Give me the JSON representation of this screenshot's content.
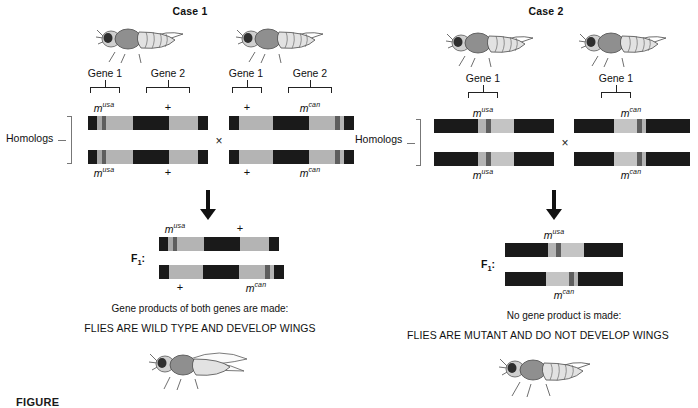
{
  "figure": {
    "caption_partial": "FIGURE",
    "background": "#ffffff"
  },
  "colors": {
    "band_black": "#1a1a1a",
    "band_gray": "#a8a8a8",
    "band_light": "#c8c8c8",
    "band_marker": "#666666",
    "bracket": "#222222",
    "homolog_bracket": "#777777",
    "text": "#111111"
  },
  "labels": {
    "homologs": "Homologs",
    "f1": "F",
    "f1_sub": "1",
    "f1_colon": ":",
    "cross_symbol": "×",
    "plus": "+",
    "gene1": "Gene 1",
    "gene2": "Gene 2"
  },
  "alleles": {
    "m_usa_base": "m",
    "m_usa_sup": "usa",
    "m_can_base": "m",
    "m_can_sup": "can"
  },
  "case1": {
    "title": "Case 1",
    "parent_left": {
      "gene_labels": [
        "Gene 1",
        "Gene 2"
      ],
      "top_allele_gene1": "m^usa",
      "top_allele_gene2": "+",
      "bottom_allele_gene1": "m^usa",
      "bottom_allele_gene2": "+"
    },
    "parent_right": {
      "gene_labels": [
        "Gene 1",
        "Gene 2"
      ],
      "top_allele_gene1": "+",
      "top_allele_gene2": "m^can",
      "bottom_allele_gene1": "+",
      "bottom_allele_gene2": "m^can"
    },
    "f1": {
      "top_left_allele": "m^usa",
      "top_right_allele": "+",
      "bottom_left_allele": "+",
      "bottom_right_allele": "m^can"
    },
    "result_line1": "Gene products of both genes are made:",
    "result_line2": "FLIES ARE WILD TYPE AND DEVELOP WINGS",
    "result_fly": "winged-wild-type-fly"
  },
  "case2": {
    "title": "Case 2",
    "parent_left": {
      "gene_labels": [
        "Gene 1"
      ],
      "top_allele_gene1": "m^usa",
      "bottom_allele_gene1": "m^usa"
    },
    "parent_right": {
      "gene_labels": [
        "Gene 1"
      ],
      "top_allele_gene1": "m^can",
      "bottom_allele_gene1": "m^can"
    },
    "f1": {
      "top_allele": "m^usa",
      "bottom_allele": "m^can"
    },
    "result_line1": "No gene product is made:",
    "result_line2": "FLIES ARE MUTANT AND DO NOT DEVELOP WINGS",
    "result_fly": "wingless-mutant-fly"
  },
  "chart_data": {
    "type": "diagram",
    "chromosomes": [
      {
        "id": "case1-parent-left-top",
        "segments": [
          {
            "color": "#1a1a1a",
            "width": 9
          },
          {
            "color": "#a8a8a8",
            "width": 5
          },
          {
            "color": "#5e5e5e",
            "width": 4
          },
          {
            "color": "#b4b4b4",
            "width": 27
          },
          {
            "color": "#1a1a1a",
            "width": 36
          },
          {
            "color": "#b4b4b4",
            "width": 29
          },
          {
            "color": "#1a1a1a",
            "width": 10
          }
        ]
      },
      {
        "id": "case1-parent-left-bottom",
        "segments": [
          {
            "color": "#1a1a1a",
            "width": 9
          },
          {
            "color": "#a8a8a8",
            "width": 5
          },
          {
            "color": "#5e5e5e",
            "width": 4
          },
          {
            "color": "#b4b4b4",
            "width": 27
          },
          {
            "color": "#1a1a1a",
            "width": 36
          },
          {
            "color": "#b4b4b4",
            "width": 29
          },
          {
            "color": "#1a1a1a",
            "width": 10
          }
        ]
      },
      {
        "id": "case1-parent-right-top",
        "segments": [
          {
            "color": "#1a1a1a",
            "width": 10
          },
          {
            "color": "#b4b4b4",
            "width": 34
          },
          {
            "color": "#1a1a1a",
            "width": 36
          },
          {
            "color": "#b4b4b4",
            "width": 26
          },
          {
            "color": "#5e5e5e",
            "width": 5
          },
          {
            "color": "#b4b4b4",
            "width": 4
          },
          {
            "color": "#1a1a1a",
            "width": 10
          }
        ]
      },
      {
        "id": "case1-parent-right-bottom",
        "segments": [
          {
            "color": "#1a1a1a",
            "width": 10
          },
          {
            "color": "#b4b4b4",
            "width": 34
          },
          {
            "color": "#1a1a1a",
            "width": 36
          },
          {
            "color": "#b4b4b4",
            "width": 26
          },
          {
            "color": "#5e5e5e",
            "width": 5
          },
          {
            "color": "#b4b4b4",
            "width": 4
          },
          {
            "color": "#1a1a1a",
            "width": 10
          }
        ]
      },
      {
        "id": "case1-f1-top",
        "segments": [
          {
            "color": "#1a1a1a",
            "width": 9
          },
          {
            "color": "#a8a8a8",
            "width": 5
          },
          {
            "color": "#5e5e5e",
            "width": 4
          },
          {
            "color": "#b4b4b4",
            "width": 27
          },
          {
            "color": "#1a1a1a",
            "width": 36
          },
          {
            "color": "#b4b4b4",
            "width": 29
          },
          {
            "color": "#1a1a1a",
            "width": 10
          }
        ]
      },
      {
        "id": "case1-f1-bottom",
        "segments": [
          {
            "color": "#1a1a1a",
            "width": 10
          },
          {
            "color": "#b4b4b4",
            "width": 34
          },
          {
            "color": "#1a1a1a",
            "width": 36
          },
          {
            "color": "#b4b4b4",
            "width": 26
          },
          {
            "color": "#5e5e5e",
            "width": 5
          },
          {
            "color": "#b4b4b4",
            "width": 4
          },
          {
            "color": "#1a1a1a",
            "width": 10
          }
        ]
      },
      {
        "id": "case2-parent-left-top",
        "segments": [
          {
            "color": "#1a1a1a",
            "width": 44
          },
          {
            "color": "#b4b4b4",
            "width": 8
          },
          {
            "color": "#5e5e5e",
            "width": 5
          },
          {
            "color": "#c4c4c4",
            "width": 23
          },
          {
            "color": "#1a1a1a",
            "width": 40
          }
        ]
      },
      {
        "id": "case2-parent-left-bottom",
        "segments": [
          {
            "color": "#1a1a1a",
            "width": 44
          },
          {
            "color": "#b4b4b4",
            "width": 8
          },
          {
            "color": "#5e5e5e",
            "width": 5
          },
          {
            "color": "#c4c4c4",
            "width": 23
          },
          {
            "color": "#1a1a1a",
            "width": 40
          }
        ]
      },
      {
        "id": "case2-parent-right-top",
        "segments": [
          {
            "color": "#1a1a1a",
            "width": 40
          },
          {
            "color": "#c4c4c4",
            "width": 23
          },
          {
            "color": "#5e5e5e",
            "width": 5
          },
          {
            "color": "#b4b4b4",
            "width": 4
          },
          {
            "color": "#1a1a1a",
            "width": 44
          }
        ]
      },
      {
        "id": "case2-parent-right-bottom",
        "segments": [
          {
            "color": "#1a1a1a",
            "width": 40
          },
          {
            "color": "#c4c4c4",
            "width": 23
          },
          {
            "color": "#5e5e5e",
            "width": 5
          },
          {
            "color": "#b4b4b4",
            "width": 4
          },
          {
            "color": "#1a1a1a",
            "width": 44
          }
        ]
      },
      {
        "id": "case2-f1-top",
        "segments": [
          {
            "color": "#1a1a1a",
            "width": 44
          },
          {
            "color": "#b4b4b4",
            "width": 8
          },
          {
            "color": "#5e5e5e",
            "width": 5
          },
          {
            "color": "#c4c4c4",
            "width": 23
          },
          {
            "color": "#1a1a1a",
            "width": 40
          }
        ]
      },
      {
        "id": "case2-f1-bottom",
        "segments": [
          {
            "color": "#1a1a1a",
            "width": 40
          },
          {
            "color": "#c4c4c4",
            "width": 23
          },
          {
            "color": "#5e5e5e",
            "width": 5
          },
          {
            "color": "#b4b4b4",
            "width": 4
          },
          {
            "color": "#1a1a1a",
            "width": 44
          }
        ]
      }
    ]
  }
}
